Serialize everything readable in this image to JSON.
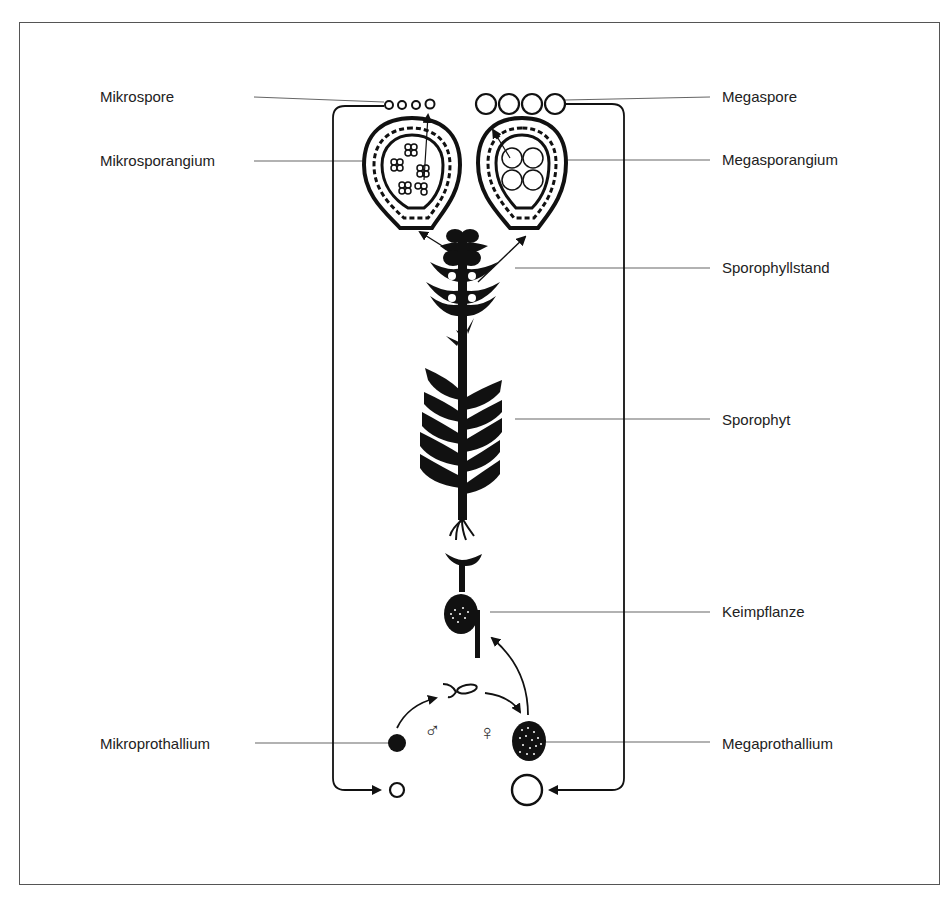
{
  "labels": {
    "left": [
      {
        "id": "mikrospore",
        "text": "Mikrospore",
        "y": 88
      },
      {
        "id": "mikrosporangium",
        "text": "Mikrosporangium",
        "y": 152
      },
      {
        "id": "mikroprothallium",
        "text": "Mikroprothallium",
        "y": 735
      }
    ],
    "right": [
      {
        "id": "megaspore",
        "text": "Megaspore",
        "y": 88
      },
      {
        "id": "megasporangium",
        "text": "Megasporangium",
        "y": 151
      },
      {
        "id": "sporophyllstand",
        "text": "Sporophyllstand",
        "y": 259
      },
      {
        "id": "sporophyt",
        "text": "Sporophyt",
        "y": 411
      },
      {
        "id": "keimpflanze",
        "text": "Keimpflanze",
        "y": 603
      },
      {
        "id": "megaprothallium",
        "text": "Megaprothallium",
        "y": 735
      }
    ]
  },
  "symbols": {
    "male": "♂",
    "female": "♀"
  },
  "colors": {
    "ink": "#111111",
    "leader": "#555555",
    "frame": "#555555"
  }
}
